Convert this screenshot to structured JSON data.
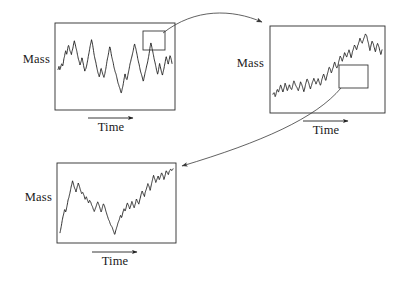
{
  "figure": {
    "background_color": "#ffffff",
    "trace_color": "#101010",
    "frame_color": "#2b2b2b",
    "arrow_color": "#3a3a3a"
  },
  "labels": {
    "mass": "Mass",
    "time": "Time"
  },
  "panels": [
    {
      "id": "panel-top-left",
      "name": "coarse-scale-series",
      "mass_label": "Mass",
      "time_label": "Time",
      "frame": {
        "x": 55,
        "y": 23,
        "width": 120,
        "height": 87
      },
      "mass_label_pos": {
        "x": 8,
        "y": 58
      },
      "time_arrow": {
        "x1": 88,
        "y1": 118,
        "x2": 135,
        "y2": 118
      },
      "time_label_pos": {
        "x": 86,
        "y": 121
      },
      "inset_box": {
        "x": 143,
        "y": 31,
        "width": 22,
        "height": 19
      },
      "zoom_level": 1
    },
    {
      "id": "panel-top-right",
      "name": "medium-scale-series",
      "mass_label": "Mass",
      "time_label": "Time",
      "frame": {
        "x": 270,
        "y": 26,
        "width": 115,
        "height": 87
      },
      "mass_label_pos": {
        "x": 222,
        "y": 62
      },
      "time_arrow": {
        "x1": 303,
        "y1": 121,
        "x2": 350,
        "y2": 121
      },
      "time_label_pos": {
        "x": 301,
        "y": 124
      },
      "inset_box": {
        "x": 339,
        "y": 65,
        "width": 29,
        "height": 23
      },
      "zoom_level": 2
    },
    {
      "id": "panel-bottom-left",
      "name": "fine-scale-series",
      "mass_label": "Mass",
      "time_label": "Time",
      "frame": {
        "x": 57,
        "y": 163,
        "width": 119,
        "height": 80
      },
      "mass_label_pos": {
        "x": 10,
        "y": 196
      },
      "time_arrow": {
        "x1": 92,
        "y1": 252,
        "x2": 139,
        "y2": 252
      },
      "time_label_pos": {
        "x": 90,
        "y": 255
      },
      "inset_box": null,
      "zoom_level": 3
    }
  ],
  "connectors": [
    {
      "id": "connector-1",
      "name": "zoom-arrow-panel1-to-panel2",
      "from_panel": "panel-top-left",
      "to_panel": "panel-top-right",
      "path": "M 163,33 C 195,8 232,9 262,22",
      "arrowhead": {
        "x": 266,
        "y": 25,
        "angle": 28
      }
    },
    {
      "id": "connector-2",
      "name": "zoom-arrow-panel2-to-panel3",
      "from_panel": "panel-top-right",
      "to_panel": "panel-bottom-left",
      "path": "M 341,88 C 316,118 262,142 182,166",
      "arrowhead": {
        "x": 178,
        "y": 167,
        "angle": 197
      }
    }
  ],
  "chart_data": {
    "type": "line",
    "xlabel": "Time",
    "ylabel": "Mass",
    "grid": false,
    "legend": null,
    "axis_ticks": false,
    "series": [
      {
        "name": "coarse-scale-series",
        "panel": "panel-top-left",
        "xlim": [
          0,
          1
        ],
        "ylim": [
          0,
          1
        ],
        "highlight_window": [
          0.73,
          0.92
        ],
        "values": [
          0.47,
          0.5,
          0.46,
          0.52,
          0.57,
          0.54,
          0.61,
          0.66,
          0.72,
          0.68,
          0.74,
          0.79,
          0.75,
          0.7,
          0.66,
          0.71,
          0.76,
          0.82,
          0.78,
          0.73,
          0.68,
          0.62,
          0.57,
          0.52,
          0.56,
          0.61,
          0.55,
          0.49,
          0.44,
          0.48,
          0.53,
          0.59,
          0.65,
          0.71,
          0.78,
          0.84,
          0.79,
          0.73,
          0.67,
          0.61,
          0.55,
          0.49,
          0.44,
          0.4,
          0.45,
          0.51,
          0.47,
          0.42,
          0.38,
          0.43,
          0.49,
          0.55,
          0.61,
          0.67,
          0.73,
          0.68,
          0.62,
          0.57,
          0.52,
          0.47,
          0.43,
          0.39,
          0.35,
          0.31,
          0.27,
          0.23,
          0.19,
          0.24,
          0.29,
          0.35,
          0.41,
          0.36,
          0.32,
          0.38,
          0.44,
          0.5,
          0.56,
          0.62,
          0.68,
          0.74,
          0.8,
          0.75,
          0.7,
          0.64,
          0.58,
          0.52,
          0.46,
          0.41,
          0.36,
          0.31,
          0.37,
          0.43,
          0.49,
          0.55,
          0.61,
          0.67,
          0.73,
          0.79,
          0.74,
          0.68,
          0.62,
          0.56,
          0.5,
          0.45,
          0.4,
          0.46,
          0.52,
          0.47,
          0.42,
          0.38,
          0.44,
          0.5,
          0.56,
          0.62,
          0.58,
          0.53,
          0.59,
          0.65,
          0.61,
          0.57
        ]
      },
      {
        "name": "medium-scale-series",
        "panel": "panel-top-right",
        "xlim": [
          0,
          1
        ],
        "ylim": [
          0,
          1
        ],
        "highlight_window": [
          0.6,
          0.85
        ],
        "values": [
          0.18,
          0.21,
          0.17,
          0.23,
          0.27,
          0.24,
          0.29,
          0.33,
          0.28,
          0.24,
          0.29,
          0.34,
          0.3,
          0.26,
          0.31,
          0.36,
          0.32,
          0.28,
          0.33,
          0.38,
          0.34,
          0.3,
          0.26,
          0.22,
          0.27,
          0.32,
          0.28,
          0.24,
          0.2,
          0.25,
          0.3,
          0.35,
          0.31,
          0.27,
          0.23,
          0.28,
          0.33,
          0.38,
          0.34,
          0.3,
          0.35,
          0.4,
          0.36,
          0.32,
          0.37,
          0.42,
          0.47,
          0.43,
          0.39,
          0.44,
          0.49,
          0.54,
          0.5,
          0.46,
          0.51,
          0.56,
          0.61,
          0.57,
          0.53,
          0.58,
          0.63,
          0.68,
          0.64,
          0.6,
          0.65,
          0.7,
          0.66,
          0.62,
          0.67,
          0.72,
          0.68,
          0.64,
          0.69,
          0.74,
          0.79,
          0.75,
          0.71,
          0.76,
          0.81,
          0.86,
          0.82,
          0.78,
          0.83,
          0.88,
          0.93,
          0.89,
          0.84,
          0.79,
          0.74,
          0.8,
          0.85,
          0.81,
          0.76,
          0.71,
          0.77,
          0.82,
          0.78,
          0.73,
          0.68,
          0.74
        ]
      },
      {
        "name": "fine-scale-series",
        "panel": "panel-bottom-left",
        "xlim": [
          0,
          1
        ],
        "ylim": [
          0,
          1
        ],
        "highlight_window": null,
        "values": [
          0.12,
          0.19,
          0.27,
          0.34,
          0.41,
          0.37,
          0.44,
          0.52,
          0.59,
          0.66,
          0.73,
          0.8,
          0.75,
          0.69,
          0.63,
          0.7,
          0.76,
          0.71,
          0.66,
          0.61,
          0.64,
          0.59,
          0.55,
          0.58,
          0.54,
          0.5,
          0.53,
          0.49,
          0.45,
          0.41,
          0.37,
          0.42,
          0.47,
          0.52,
          0.48,
          0.43,
          0.39,
          0.45,
          0.5,
          0.46,
          0.41,
          0.36,
          0.31,
          0.27,
          0.23,
          0.19,
          0.15,
          0.11,
          0.08,
          0.13,
          0.18,
          0.24,
          0.29,
          0.35,
          0.31,
          0.37,
          0.43,
          0.39,
          0.45,
          0.51,
          0.47,
          0.43,
          0.49,
          0.55,
          0.51,
          0.47,
          0.53,
          0.59,
          0.55,
          0.51,
          0.57,
          0.63,
          0.69,
          0.64,
          0.59,
          0.65,
          0.71,
          0.77,
          0.72,
          0.67,
          0.73,
          0.79,
          0.85,
          0.8,
          0.75,
          0.81,
          0.87,
          0.83,
          0.89,
          0.94,
          0.9,
          0.86,
          0.91,
          0.96,
          0.92,
          0.88,
          0.93,
          0.97,
          0.95,
          0.98
        ]
      }
    ]
  }
}
